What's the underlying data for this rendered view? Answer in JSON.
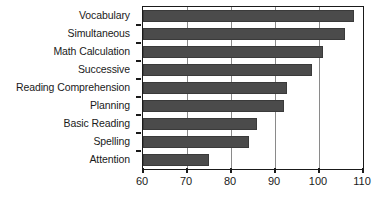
{
  "chart_data": {
    "type": "bar",
    "orientation": "horizontal",
    "title": "",
    "xlabel": "",
    "ylabel": "",
    "xlim": [
      60,
      110
    ],
    "xticks": [
      60,
      70,
      80,
      90,
      100,
      110
    ],
    "grid": "vertical",
    "legend": "none",
    "bar_color": "#4b4b4b",
    "axis_color": "#1a1a1a",
    "gridline_color": "#8a8a8a",
    "categories": [
      "Vocabulary",
      "Simultaneous",
      "Math Calculation",
      "Successive",
      "Reading Comprehension",
      "Planning",
      "Basic Reading",
      "Spelling",
      "Attention"
    ],
    "values": [
      108,
      106,
      101,
      98.5,
      92.7,
      92,
      86,
      84,
      75
    ]
  }
}
